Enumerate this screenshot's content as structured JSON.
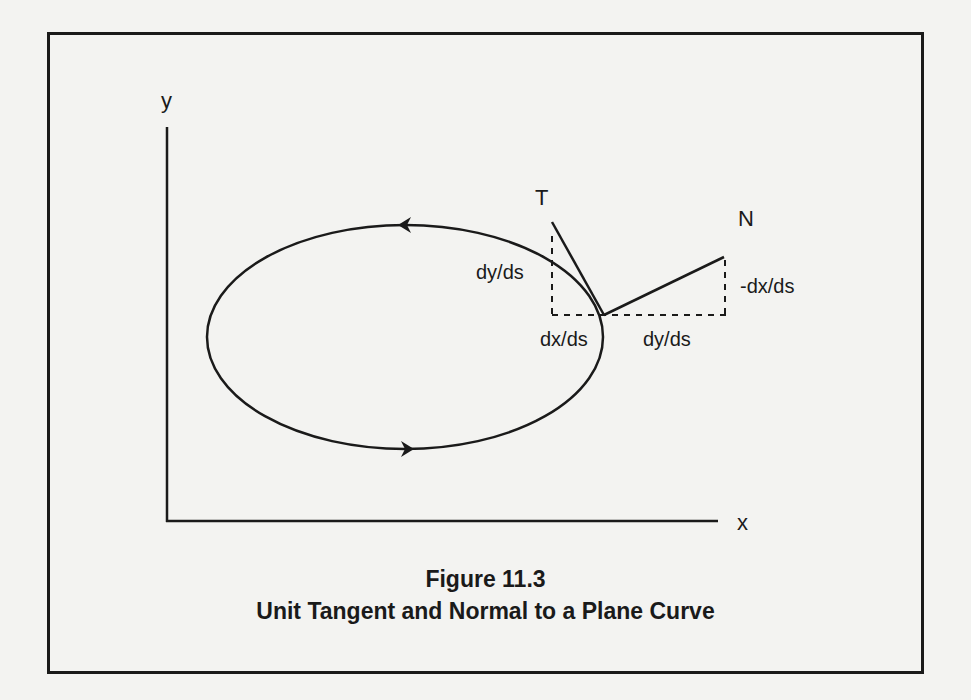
{
  "figure": {
    "number_label": "Figure 11.3",
    "title": "Unit Tangent and Normal to a Plane Curve"
  },
  "axes": {
    "x_label": "x",
    "y_label": "y"
  },
  "vectors": {
    "tangent_label": "T",
    "normal_label": "N"
  },
  "components": {
    "tangent_vertical": "dy/ds",
    "tangent_horizontal": "dx/ds",
    "normal_horizontal": "dy/ds",
    "normal_vertical": "-dx/ds"
  },
  "colors": {
    "ink": "#1a1a1a",
    "paper": "#f3f3f1"
  }
}
